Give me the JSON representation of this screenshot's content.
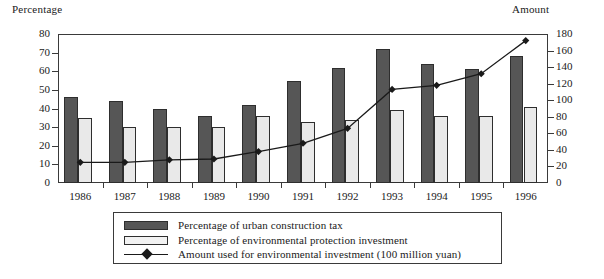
{
  "axes": {
    "left_title": "Percentage",
    "right_title": "Amount",
    "left_ticks": [
      "80",
      "70",
      "60",
      "50",
      "40",
      "30",
      "20",
      "10",
      "0"
    ],
    "right_ticks": [
      "180",
      "160",
      "140",
      "120",
      "100",
      "80",
      "60",
      "40",
      "20",
      "0"
    ]
  },
  "legend": {
    "items": [
      {
        "label": "Percentage of urban construction tax",
        "swatch": "dark-bar-swatch"
      },
      {
        "label": "Percentage of environmental protection investment",
        "swatch": "light-bar-swatch"
      },
      {
        "label": "Amount used for environmental investment (100 million yuan)",
        "swatch": "line-marker-swatch"
      }
    ]
  },
  "chart_data": {
    "type": "bar",
    "title": "",
    "xlabel": "",
    "ylabel": "Percentage",
    "y2label": "Amount",
    "ylim": [
      0,
      80
    ],
    "y2lim": [
      0,
      180
    ],
    "grid": false,
    "legend_position": "bottom",
    "categories": [
      "1986",
      "1987",
      "1988",
      "1989",
      "1990",
      "1991",
      "1992",
      "1993",
      "1994",
      "1995",
      "1996"
    ],
    "series": [
      {
        "name": "Percentage of urban construction tax",
        "type": "bar",
        "axis": "left",
        "color": "#565656",
        "values": [
          46,
          44,
          40,
          36,
          42,
          55,
          62,
          72,
          64,
          61,
          68
        ]
      },
      {
        "name": "Percentage of environmental protection investment",
        "type": "bar",
        "axis": "left",
        "color": "#e9e9e9",
        "values": [
          35,
          30,
          30,
          30,
          36,
          33,
          34,
          39,
          36,
          36,
          41
        ]
      },
      {
        "name": "Amount used for environmental investment (100 million yuan)",
        "type": "line",
        "axis": "right",
        "color": "#1a1a1a",
        "marker": "diamond",
        "values": [
          25,
          25,
          28,
          29,
          38,
          48,
          66,
          113,
          118,
          132,
          172
        ]
      }
    ]
  }
}
